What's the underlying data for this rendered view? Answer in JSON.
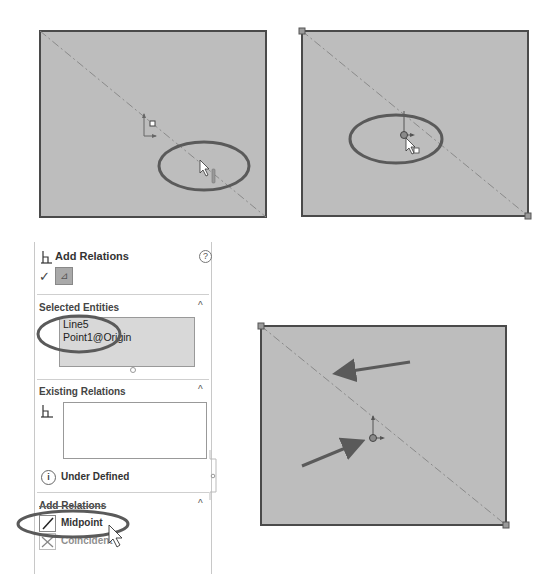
{
  "colors": {
    "sketch_fill": "#bdbdbd",
    "sketch_edge": "#4a4a4a",
    "centerline": "#8a8a8a",
    "callout": "#5a5a5a",
    "panel_border": "#c8c8c8",
    "selection_bg": "#d8d8d8"
  },
  "viewports": [
    {
      "name": "step-1-hover-line",
      "rect": {
        "x": 40,
        "y": 31,
        "w": 226,
        "h": 186
      },
      "cursor_icon": "arrow-cursor-with-line-icon",
      "callout": "ellipse-around-cursor-on-line"
    },
    {
      "name": "step-2-select-origin",
      "rect": {
        "x": 302,
        "y": 31,
        "w": 226,
        "h": 185
      },
      "cursor_icon": "arrow-cursor-with-point-icon",
      "callout": "ellipse-around-origin"
    },
    {
      "name": "step-3-result",
      "rect": {
        "x": 261,
        "y": 326,
        "w": 245,
        "h": 199
      },
      "annotations": [
        "arrow-to-line",
        "arrow-to-origin"
      ]
    }
  ],
  "property_manager": {
    "title": "Add Relations",
    "help_icon": "?",
    "ok_icon": "✓",
    "pin_icon": "⊿",
    "sections": {
      "selected_entities": {
        "label": "Selected Entities",
        "items": [
          "Line5",
          "Point1@Origin"
        ]
      },
      "existing_relations": {
        "label": "Existing Relations",
        "status": "Under Defined",
        "status_icon": "i"
      },
      "add_relations": {
        "label": "Add Relations",
        "options": [
          "Midpoint",
          "Coincident"
        ]
      }
    },
    "collapse_glyph": "^"
  }
}
